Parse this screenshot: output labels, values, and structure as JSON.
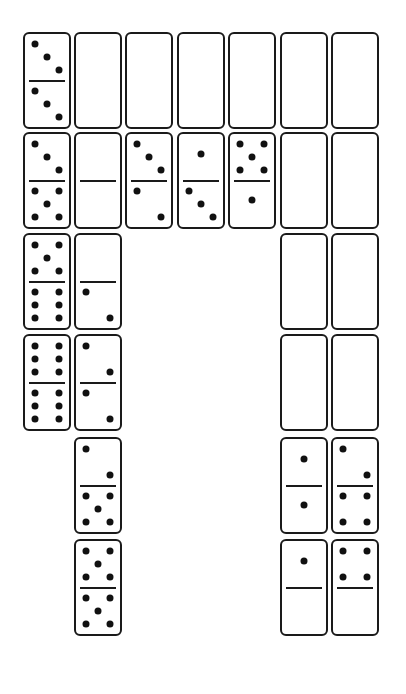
{
  "puzzle": {
    "description": "Domino arrangement puzzle",
    "grid": {
      "col_lefts": [
        23,
        74,
        125,
        177,
        228,
        280,
        331
      ],
      "row_tops": [
        32,
        132,
        233,
        334,
        437,
        539
      ]
    },
    "colors": {
      "ink": "#1a1a1a",
      "background": "#ffffff"
    },
    "dominoes": [
      {
        "col": 0,
        "row": 0,
        "top": 3,
        "bottom": 3,
        "divider": true
      },
      {
        "col": 1,
        "row": 0,
        "top": null,
        "bottom": null,
        "divider": false
      },
      {
        "col": 2,
        "row": 0,
        "top": null,
        "bottom": null,
        "divider": false
      },
      {
        "col": 3,
        "row": 0,
        "top": null,
        "bottom": null,
        "divider": false
      },
      {
        "col": 4,
        "row": 0,
        "top": null,
        "bottom": null,
        "divider": false
      },
      {
        "col": 5,
        "row": 0,
        "top": null,
        "bottom": null,
        "divider": false
      },
      {
        "col": 6,
        "row": 0,
        "top": null,
        "bottom": null,
        "divider": false
      },
      {
        "col": 0,
        "row": 1,
        "top": 3,
        "bottom": 5,
        "divider": true
      },
      {
        "col": 1,
        "row": 1,
        "top": 0,
        "bottom": 0,
        "divider": true
      },
      {
        "col": 2,
        "row": 1,
        "top": 3,
        "bottom": 2,
        "divider": true
      },
      {
        "col": 3,
        "row": 1,
        "top": 1,
        "bottom": 3,
        "divider": true
      },
      {
        "col": 4,
        "row": 1,
        "top": 5,
        "bottom": 1,
        "divider": true
      },
      {
        "col": 5,
        "row": 1,
        "top": null,
        "bottom": null,
        "divider": false
      },
      {
        "col": 6,
        "row": 1,
        "top": null,
        "bottom": null,
        "divider": false
      },
      {
        "col": 0,
        "row": 2,
        "top": 5,
        "bottom": 6,
        "divider": true
      },
      {
        "col": 1,
        "row": 2,
        "top": 0,
        "bottom": 2,
        "divider": true
      },
      {
        "col": 5,
        "row": 2,
        "top": null,
        "bottom": null,
        "divider": false
      },
      {
        "col": 6,
        "row": 2,
        "top": null,
        "bottom": null,
        "divider": false
      },
      {
        "col": 0,
        "row": 3,
        "top": 6,
        "bottom": 6,
        "divider": true
      },
      {
        "col": 1,
        "row": 3,
        "top": 2,
        "bottom": 2,
        "divider": true
      },
      {
        "col": 5,
        "row": 3,
        "top": null,
        "bottom": null,
        "divider": false
      },
      {
        "col": 6,
        "row": 3,
        "top": null,
        "bottom": null,
        "divider": false
      },
      {
        "col": 1,
        "row": 4,
        "top": 2,
        "bottom": 5,
        "divider": true
      },
      {
        "col": 5,
        "row": 4,
        "top": 1,
        "bottom": 1,
        "divider": true
      },
      {
        "col": 6,
        "row": 4,
        "top": 2,
        "bottom": 4,
        "divider": true
      },
      {
        "col": 1,
        "row": 5,
        "top": 5,
        "bottom": 5,
        "divider": true
      },
      {
        "col": 5,
        "row": 5,
        "top": 1,
        "bottom": 0,
        "divider": true
      },
      {
        "col": 6,
        "row": 5,
        "top": 4,
        "bottom": 0,
        "divider": true
      }
    ]
  }
}
